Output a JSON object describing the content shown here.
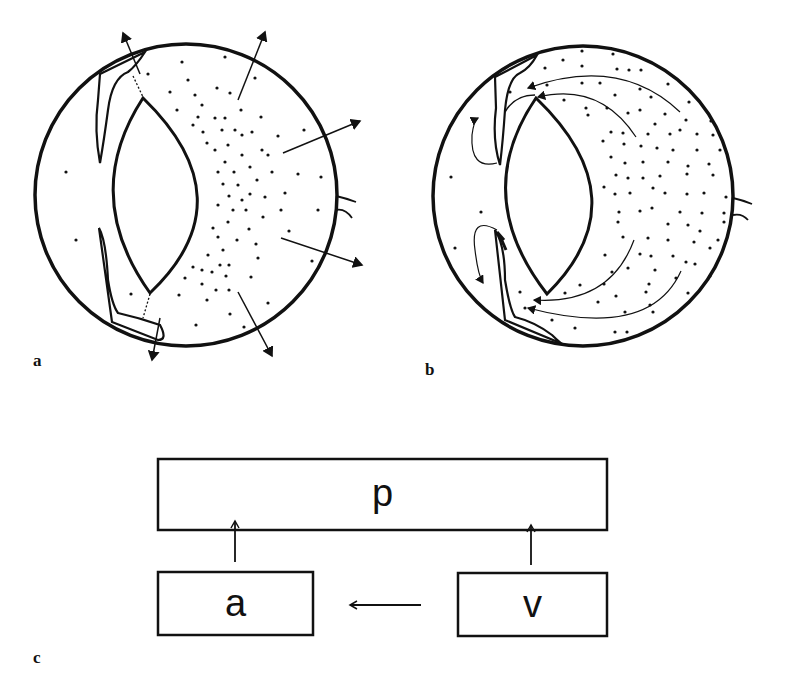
{
  "figure": {
    "panels": [
      {
        "id": "a",
        "label": "a",
        "description": "Eye cross-section with outward arrows from vitreous body (diffusion outward)"
      },
      {
        "id": "b",
        "label": "b",
        "description": "Eye cross-section with curved arrows showing flow toward anterior chamber and lens"
      },
      {
        "id": "c",
        "label": "c",
        "description": "Block diagram of compartments"
      }
    ],
    "block_diagram": {
      "boxes": [
        {
          "id": "p",
          "label": "p"
        },
        {
          "id": "a",
          "label": "a"
        },
        {
          "id": "v",
          "label": "v"
        }
      ],
      "arrows": [
        {
          "from": "a",
          "to": "p"
        },
        {
          "from": "v",
          "to": "p"
        },
        {
          "from": "v",
          "to": "a"
        }
      ]
    },
    "colors": {
      "ink": "#111111",
      "background": "#ffffff"
    }
  }
}
